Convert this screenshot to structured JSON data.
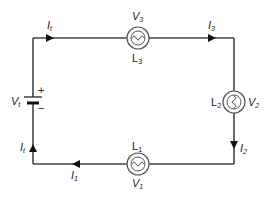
{
  "diagram": {
    "type": "series-circuit",
    "colors": {
      "wire": "#444444",
      "background": "#ffffff",
      "text": "#222222"
    },
    "battery": {
      "label": "V",
      "sub": "t",
      "plus": "+",
      "minus": "−"
    },
    "lamps": {
      "top": {
        "name": "L",
        "name_sub": "3",
        "voltage": "V",
        "voltage_sub": "3"
      },
      "right": {
        "name": "L",
        "name_sub": "2",
        "voltage": "V",
        "voltage_sub": "2"
      },
      "bottom": {
        "name": "L",
        "name_sub": "1",
        "voltage": "V",
        "voltage_sub": "1"
      }
    },
    "currents": {
      "top_left": {
        "label": "I",
        "sub": "t"
      },
      "top_right": {
        "label": "I",
        "sub": "3"
      },
      "right": {
        "label": "I",
        "sub": "2"
      },
      "bottom": {
        "label": "I",
        "sub": "1"
      },
      "left": {
        "label": "I",
        "sub": "t"
      }
    }
  }
}
